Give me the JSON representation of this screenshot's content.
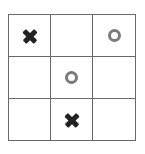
{
  "game": "tic-tac-toe",
  "board": [
    [
      "X",
      "",
      "O"
    ],
    [
      "",
      "O",
      ""
    ],
    [
      "",
      "X",
      ""
    ]
  ],
  "colors": {
    "x": "#222222",
    "o": "#7a7a7a",
    "grid": "#6a6a6a"
  }
}
